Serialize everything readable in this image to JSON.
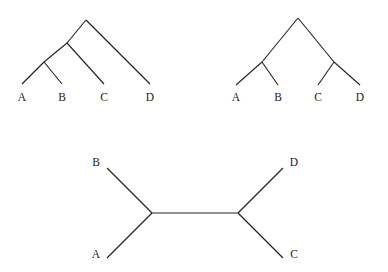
{
  "figure": {
    "background_color": "#ffffff",
    "line_color": "#262626",
    "label_color": "#1c1c1c",
    "width": 388,
    "height": 272,
    "panel_count": 3
  },
  "chart_data": {
    "type": "diagram",
    "subtype": "phylogenetic-tree-set",
    "title": "",
    "xlabel": "",
    "ylabel": "",
    "panels": [
      {
        "id": "tree-left",
        "name": "rooted-ladder-tree",
        "topology": "(((A,B),C),D)",
        "orientation": "rooted-downward-tips",
        "taxa": [
          "A",
          "B",
          "C",
          "D"
        ],
        "root": {
          "x": 86,
          "y": 20
        },
        "internal_nodes": [
          {
            "id": "n1",
            "x": 86,
            "y": 20,
            "children": [
              "n2",
              "D"
            ]
          },
          {
            "id": "n2",
            "x": 67,
            "y": 43,
            "children": [
              "n3",
              "C"
            ]
          },
          {
            "id": "n3",
            "x": 44,
            "y": 62,
            "children": [
              "A",
              "B"
            ]
          }
        ],
        "tips": [
          {
            "taxon": "A",
            "x": 22,
            "y": 84
          },
          {
            "taxon": "B",
            "x": 62,
            "y": 84
          },
          {
            "taxon": "C",
            "x": 104,
            "y": 84
          },
          {
            "taxon": "D",
            "x": 150,
            "y": 84
          }
        ],
        "labels": [
          {
            "text": "A",
            "x": 22,
            "y": 101
          },
          {
            "text": "B",
            "x": 62,
            "y": 101
          },
          {
            "text": "C",
            "x": 104,
            "y": 101
          },
          {
            "text": "D",
            "x": 150,
            "y": 101
          }
        ]
      },
      {
        "id": "tree-right",
        "name": "rooted-balanced-tree",
        "topology": "((A,B),(C,D))",
        "orientation": "rooted-downward-tips",
        "taxa": [
          "A",
          "B",
          "C",
          "D"
        ],
        "root": {
          "x": 298,
          "y": 18
        },
        "internal_nodes": [
          {
            "id": "m1",
            "x": 298,
            "y": 18,
            "children": [
              "m2",
              "m3"
            ]
          },
          {
            "id": "m2",
            "x": 262,
            "y": 62,
            "children": [
              "A",
              "B"
            ]
          },
          {
            "id": "m3",
            "x": 334,
            "y": 62,
            "children": [
              "C",
              "D"
            ]
          }
        ],
        "tips": [
          {
            "taxon": "A",
            "x": 236,
            "y": 85
          },
          {
            "taxon": "B",
            "x": 278,
            "y": 85
          },
          {
            "taxon": "C",
            "x": 318,
            "y": 85
          },
          {
            "taxon": "D",
            "x": 360,
            "y": 85
          }
        ],
        "labels": [
          {
            "text": "A",
            "x": 236,
            "y": 101
          },
          {
            "text": "B",
            "x": 278,
            "y": 101
          },
          {
            "text": "C",
            "x": 318,
            "y": 101
          },
          {
            "text": "D",
            "x": 360,
            "y": 101
          }
        ]
      },
      {
        "id": "tree-bottom",
        "name": "unrooted-tree",
        "topology": "(A,B,(C,D))",
        "orientation": "unrooted-horizontal",
        "taxa": [
          "A",
          "B",
          "C",
          "D"
        ],
        "internal_nodes": [
          {
            "id": "u1",
            "x": 152,
            "y": 213,
            "children": [
              "A",
              "B",
              "u2"
            ]
          },
          {
            "id": "u2",
            "x": 238,
            "y": 213,
            "children": [
              "C",
              "D",
              "u1"
            ]
          }
        ],
        "internal_edge": {
          "from": "u1",
          "to": "u2",
          "x1": 152,
          "y1": 213,
          "x2": 238,
          "y2": 213
        },
        "tips": [
          {
            "taxon": "B",
            "x": 107,
            "y": 168
          },
          {
            "taxon": "A",
            "x": 107,
            "y": 258
          },
          {
            "taxon": "D",
            "x": 283,
            "y": 168
          },
          {
            "taxon": "C",
            "x": 283,
            "y": 258
          }
        ],
        "labels": [
          {
            "text": "B",
            "x": 96,
            "y": 166
          },
          {
            "text": "A",
            "x": 96,
            "y": 258
          },
          {
            "text": "D",
            "x": 294,
            "y": 166
          },
          {
            "text": "C",
            "x": 294,
            "y": 258
          }
        ]
      }
    ],
    "legend": [],
    "annotations": [],
    "grid": false
  }
}
